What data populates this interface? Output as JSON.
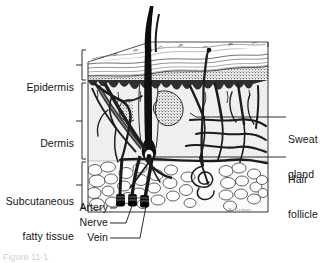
{
  "figure": {
    "top_faint_text": "",
    "bottom_caption": "Figure 11-1",
    "artist_signature": "N. Grimes"
  },
  "colors": {
    "ink": "#141414",
    "paper": "#ffffff",
    "epidermis_band": "#6b6b6b",
    "dermis_fill": "#ededed",
    "fat_fill": "#fbfbfb",
    "vessel": "#2a2a2a",
    "leader": "#1a1a1a"
  },
  "left_labels": [
    {
      "name": "epidermis",
      "lines": [
        "Epidermis"
      ],
      "x": 16,
      "y": 62,
      "width": 62,
      "bracket": {
        "top": 48,
        "bottom": 80
      }
    },
    {
      "name": "dermis",
      "lines": [
        "Dermis"
      ],
      "x": 16,
      "y": 116,
      "width": 62,
      "bracket": {
        "top": 82,
        "bottom": 160
      }
    },
    {
      "name": "subcutaneous-fatty-tissue",
      "lines": [
        "Subcutaneous",
        "fatty tissue"
      ],
      "x": 2,
      "y": 162,
      "width": 76,
      "bracket": {
        "top": 161,
        "bottom": 205
      }
    }
  ],
  "right_labels": [
    {
      "name": "sweat-gland",
      "lines": [
        "Sweat",
        "gland"
      ],
      "x": 288,
      "y": 110,
      "leader_y": 117,
      "leader_x1": 275,
      "leader_x2": 196
    },
    {
      "name": "hair-follicle",
      "lines": [
        "Hair",
        "follicle"
      ],
      "x": 288,
      "y": 150,
      "leader_y": 157,
      "leader_x1": 275,
      "leader_x2": 150
    }
  ],
  "bottom_labels": [
    {
      "name": "artery",
      "text": "Artery",
      "x": 62,
      "y": 206,
      "width": 46,
      "leader": {
        "x1": 112,
        "y1": 210,
        "x2": 121,
        "y2": 199
      }
    },
    {
      "name": "nerve",
      "text": "Nerve",
      "x": 62,
      "y": 221,
      "width": 46,
      "leader": {
        "x1": 112,
        "y1": 225,
        "x2": 133,
        "y2": 200
      }
    },
    {
      "name": "vein",
      "text": "Vein",
      "x": 62,
      "y": 236,
      "width": 46,
      "leader": {
        "x1": 112,
        "y1": 240,
        "x2": 145,
        "y2": 201
      }
    }
  ],
  "block": {
    "left": 88,
    "right": 268,
    "top": 46,
    "bottom": 212,
    "epidermis_top": 46,
    "epidermis_bottom": 80,
    "dermis_top": 80,
    "dermis_bottom": 161,
    "fat_top": 161,
    "fat_bottom": 212
  },
  "structures": {
    "hair_shaft_label": "hair-shaft",
    "hair_root_label": "hair-root-bulb",
    "sweat_duct_label": "sweat-duct",
    "sebaceous_label": "sebaceous-gland",
    "fat_lobule_label": "fat-lobule",
    "vessel_bundle_labels": [
      "artery-stub",
      "nerve-stub",
      "vein-stub"
    ]
  }
}
